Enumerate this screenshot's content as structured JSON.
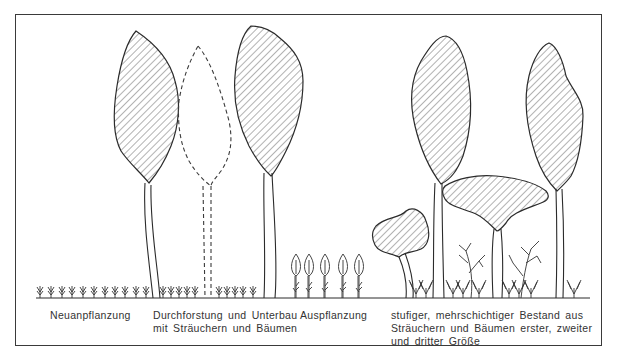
{
  "figure": {
    "frame_color": "#3a3a3a",
    "line_color": "#2b2b2b",
    "background": "#ffffff",
    "fill_pattern": "diagonal-hatch"
  },
  "stages": [
    {
      "id": "neuanpflanzung",
      "label_lines": [
        "Neuanpflanzung"
      ],
      "elements": [
        "small-seedling-icon"
      ]
    },
    {
      "id": "durchforstung",
      "label_lines": [
        "Durchforstung und Unterbau",
        "mit Sträuchern und Bäumen"
      ],
      "elements": [
        "hatched-tree-crown",
        "dashed-removed-tree-outline",
        "hatched-tree-crown",
        "small-seedling-icon"
      ]
    },
    {
      "id": "auspflanzung",
      "label_lines": [
        "Auspflanzung"
      ],
      "elements": [
        "young-tree-sapling-icon"
      ]
    },
    {
      "id": "stufiger-bestand",
      "label_lines": [
        "stufiger, mehrschichtiger Bestand aus",
        "Sträuchern und Bäumen erster, zweiter",
        "und dritter Größe"
      ],
      "elements": [
        "small-tree-crown",
        "tall-tree-crown",
        "wide-tree-crown",
        "tall-tree-crown",
        "branching-shrub-icon"
      ]
    }
  ]
}
